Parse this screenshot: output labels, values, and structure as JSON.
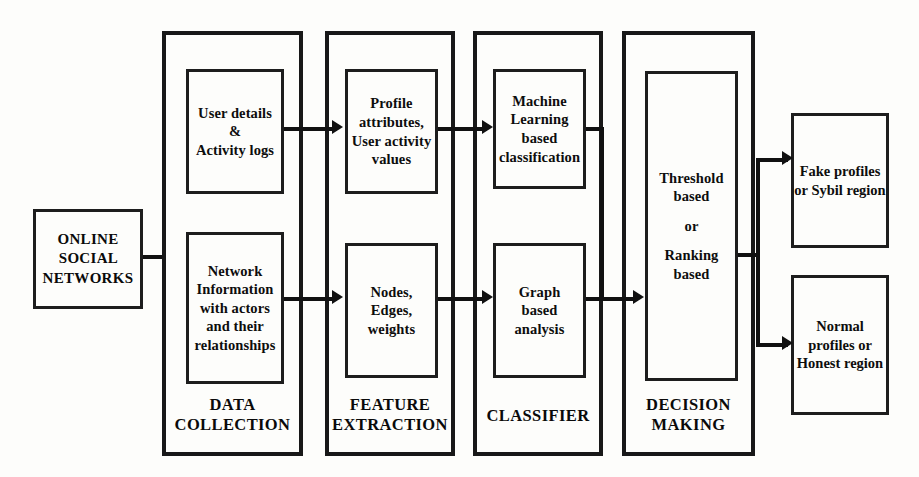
{
  "diagram": {
    "source": {
      "label": "ONLINE\nSOCIAL\nNETWORKS",
      "lines": [
        "ONLINE",
        "SOCIAL",
        "NETWORKS"
      ]
    },
    "stages": [
      {
        "id": "data-collection",
        "label": "DATA\nCOLLECTION",
        "label_lines": [
          "DATA",
          "COLLECTION"
        ],
        "items": [
          {
            "id": "user-details",
            "lines": [
              "User details",
              "&",
              "Activity logs"
            ]
          },
          {
            "id": "network-information",
            "lines": [
              "Network",
              "Information",
              "with actors",
              "and their",
              "relationships"
            ]
          }
        ]
      },
      {
        "id": "feature-extraction",
        "label": "FEATURE\nEXTRACTION",
        "label_lines": [
          "FEATURE",
          "EXTRACTION"
        ],
        "items": [
          {
            "id": "profile-attributes",
            "lines": [
              "Profile",
              "attributes,",
              "User activity",
              "values"
            ]
          },
          {
            "id": "nodes-edges-weights",
            "lines": [
              "Nodes,",
              "Edges,",
              "weights"
            ]
          }
        ]
      },
      {
        "id": "classifier",
        "label": "CLASSIFIER",
        "label_lines": [
          "CLASSIFIER"
        ],
        "items": [
          {
            "id": "ml-classification",
            "lines": [
              "Machine",
              "Learning",
              "based",
              "classification"
            ]
          },
          {
            "id": "graph-analysis",
            "lines": [
              "Graph",
              "based",
              "analysis"
            ]
          }
        ]
      },
      {
        "id": "decision-making",
        "label": "DECISION\nMAKING",
        "label_lines": [
          "DECISION",
          "MAKING"
        ],
        "items": [
          {
            "id": "threshold-ranking",
            "lines": [
              "Threshold",
              "based",
              "",
              "or",
              "",
              "Ranking",
              "based"
            ]
          }
        ]
      }
    ],
    "outputs": [
      {
        "id": "fake-profiles",
        "lines": [
          "Fake",
          "profiles",
          "or",
          "Sybil region"
        ]
      },
      {
        "id": "normal-profiles",
        "lines": [
          "Normal",
          "profiles",
          "or",
          "Honest",
          "region"
        ]
      }
    ],
    "colors": {
      "ink": "#111111",
      "box_border": "#1d1d1d",
      "stage_border": "#181818",
      "background": "#fdfdfb"
    }
  }
}
